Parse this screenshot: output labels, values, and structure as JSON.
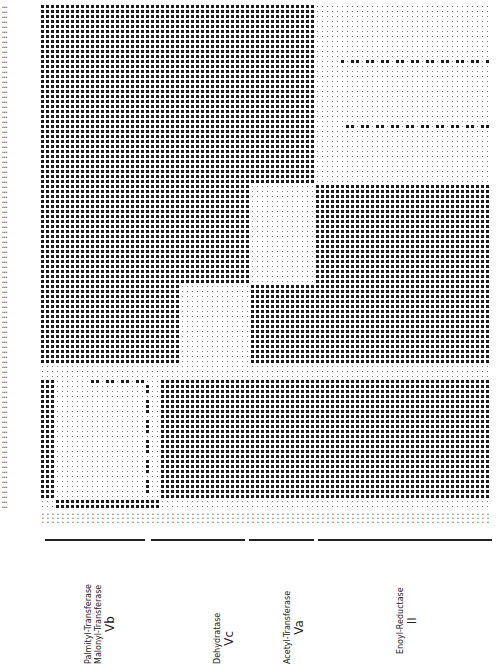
{
  "figure": {
    "type": "dot-matrix homology plot",
    "grid": {
      "x0": 42,
      "y0": 6,
      "step": 5,
      "cols": 90,
      "rows": 101
    },
    "regions": [
      {
        "x1": 42,
        "x2": 316,
        "y1": 6,
        "y2": 182,
        "density": "dense"
      },
      {
        "x1": 316,
        "x2": 495,
        "y1": 6,
        "y2": 182,
        "density": "sparse"
      },
      {
        "x1": 42,
        "x2": 150,
        "y1": 182,
        "y2": 282,
        "density": "dense"
      },
      {
        "x1": 150,
        "x2": 248,
        "y1": 182,
        "y2": 282,
        "density": "dense"
      },
      {
        "x1": 248,
        "x2": 316,
        "y1": 182,
        "y2": 282,
        "density": "sparse"
      },
      {
        "x1": 316,
        "x2": 495,
        "y1": 182,
        "y2": 282,
        "density": "dense"
      },
      {
        "x1": 42,
        "x2": 178,
        "y1": 282,
        "y2": 366,
        "density": "dense"
      },
      {
        "x1": 178,
        "x2": 248,
        "y1": 282,
        "y2": 366,
        "density": "sparse"
      },
      {
        "x1": 248,
        "x2": 495,
        "y1": 282,
        "y2": 366,
        "density": "dense"
      },
      {
        "x1": 42,
        "x2": 495,
        "y1": 366,
        "y2": 381,
        "density": "sparse"
      },
      {
        "x1": 42,
        "x2": 56,
        "y1": 381,
        "y2": 501,
        "density": "dense"
      },
      {
        "x1": 56,
        "x2": 160,
        "y1": 381,
        "y2": 501,
        "density": "sparse"
      },
      {
        "x1": 160,
        "x2": 495,
        "y1": 381,
        "y2": 501,
        "density": "dense"
      },
      {
        "x1": 42,
        "x2": 56,
        "y1": 501,
        "y2": 511,
        "density": "sparse"
      },
      {
        "x1": 56,
        "x2": 158,
        "y1": 501,
        "y2": 511,
        "density": "dense"
      },
      {
        "x1": 158,
        "x2": 495,
        "y1": 501,
        "y2": 511,
        "density": "sparse"
      }
    ],
    "accents": [
      {
        "x1": 92,
        "x2": 150,
        "y": 382,
        "note": "dense row inside Vb block"
      },
      {
        "x1": 146,
        "x2": 150,
        "y1": 382,
        "y2": 498,
        "note": "dense column inside Vb block"
      },
      {
        "x1": 340,
        "x2": 495,
        "y": 62,
        "note": "scattered dots row"
      },
      {
        "x1": 340,
        "x2": 495,
        "y": 127,
        "note": "scattered dots row"
      }
    ]
  },
  "domain_bars": [
    {
      "x1": 45,
      "x2": 145
    },
    {
      "x1": 151,
      "x2": 245
    },
    {
      "x1": 249,
      "x2": 314
    },
    {
      "x1": 318,
      "x2": 492
    }
  ],
  "domain_labels": [
    {
      "lines": [
        "Palmityl-Transferase",
        "Malonyl-Transferase"
      ],
      "roman": "Vb",
      "x": 84,
      "y": 664
    },
    {
      "lines": [
        "Dehydratase"
      ],
      "roman": "Vc",
      "x": 213,
      "y": 664
    },
    {
      "lines": [
        "Acetyl-Transferase"
      ],
      "roman": "Va",
      "x": 283,
      "y": 664
    },
    {
      "lines": [
        "Enoyl-Reductase"
      ],
      "roman": "II",
      "x": 396,
      "y": 654
    }
  ]
}
